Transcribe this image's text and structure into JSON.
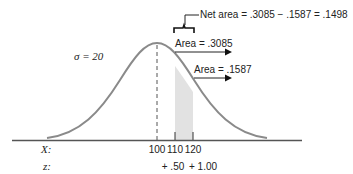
{
  "diagram": {
    "type": "normal-curve-area",
    "sigma_label": "σ = 20",
    "net_area_label": "Net  area = .3085 − .1587 = .1498",
    "area_labels": [
      {
        "label": "Area = .3085"
      },
      {
        "label": "Area = .1587"
      }
    ],
    "x_axis": {
      "label": "X:",
      "ticks": [
        "100",
        "110",
        "120"
      ]
    },
    "z_axis": {
      "label": "z:",
      "ticks": [
        "+ .50",
        "+ 1.00"
      ]
    },
    "colors": {
      "curve": "#8a8a8a",
      "axis": "#555555",
      "shade": "#e2e2e2",
      "text": "#222222"
    }
  }
}
